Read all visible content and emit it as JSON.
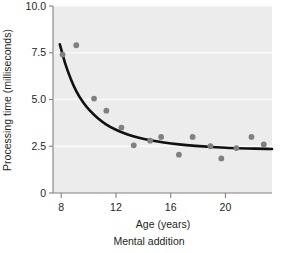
{
  "figure": {
    "caption": "Mental addition",
    "background_color": "#ffffff",
    "plot_background_color": "#ececec",
    "gridline_color": "#fafafa",
    "axis_color": "#808080",
    "point_color": "#808080",
    "curve_color": "#111111"
  },
  "chart_data": {
    "type": "scatter",
    "title": "",
    "subtitle": "Mental addition",
    "xlabel": "Age (years)",
    "ylabel": "Processing time (milliseconds)",
    "xlim": [
      7.4,
      23.4
    ],
    "ylim": [
      0,
      10.0
    ],
    "xticks": [
      8,
      12,
      16,
      20
    ],
    "xticklabels": [
      "8",
      "12",
      "16",
      "20"
    ],
    "yticks": [
      0,
      2.5,
      5.0,
      7.5,
      10.0
    ],
    "yticklabels": [
      "0",
      "2.5",
      "5.0",
      "7.5",
      "10.0"
    ],
    "grid": true,
    "grid_axis": "y",
    "legend": "none",
    "series": [
      {
        "name": "Observed processing time",
        "type": "scatter",
        "marker": "circle",
        "color": "#808080",
        "points": [
          {
            "x": 8.1,
            "y": 7.4
          },
          {
            "x": 9.1,
            "y": 7.9
          },
          {
            "x": 10.4,
            "y": 5.05
          },
          {
            "x": 11.3,
            "y": 4.4
          },
          {
            "x": 12.4,
            "y": 3.5
          },
          {
            "x": 13.3,
            "y": 2.55
          },
          {
            "x": 14.5,
            "y": 2.8
          },
          {
            "x": 15.3,
            "y": 3.0
          },
          {
            "x": 16.6,
            "y": 2.05
          },
          {
            "x": 17.6,
            "y": 3.0
          },
          {
            "x": 18.9,
            "y": 2.5
          },
          {
            "x": 19.7,
            "y": 1.85
          },
          {
            "x": 20.8,
            "y": 2.4
          },
          {
            "x": 21.9,
            "y": 3.0
          },
          {
            "x": 22.8,
            "y": 2.6
          }
        ]
      },
      {
        "name": "Fitted exponential decay curve",
        "type": "line",
        "color": "#111111",
        "points": [
          {
            "x": 7.9,
            "y": 7.95
          },
          {
            "x": 8.3,
            "y": 6.9
          },
          {
            "x": 8.7,
            "y": 6.1
          },
          {
            "x": 9.1,
            "y": 5.45
          },
          {
            "x": 9.6,
            "y": 4.85
          },
          {
            "x": 10.1,
            "y": 4.4
          },
          {
            "x": 10.7,
            "y": 3.98
          },
          {
            "x": 11.3,
            "y": 3.66
          },
          {
            "x": 12.0,
            "y": 3.38
          },
          {
            "x": 12.8,
            "y": 3.14
          },
          {
            "x": 13.6,
            "y": 2.97
          },
          {
            "x": 14.5,
            "y": 2.82
          },
          {
            "x": 15.5,
            "y": 2.7
          },
          {
            "x": 16.6,
            "y": 2.6
          },
          {
            "x": 17.8,
            "y": 2.52
          },
          {
            "x": 19.0,
            "y": 2.46
          },
          {
            "x": 20.3,
            "y": 2.41
          },
          {
            "x": 21.6,
            "y": 2.38
          },
          {
            "x": 23.0,
            "y": 2.36
          },
          {
            "x": 23.4,
            "y": 2.35
          }
        ]
      }
    ]
  }
}
